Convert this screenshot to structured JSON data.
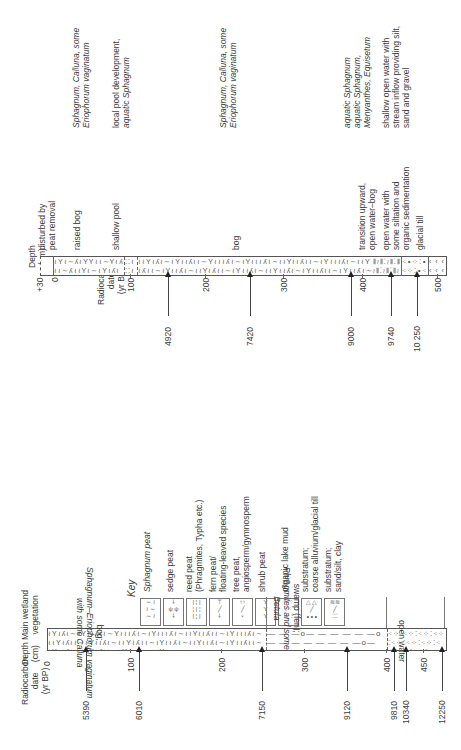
{
  "headers": {
    "radiocarbon": [
      "Radiocarbon",
      "date",
      "(yr BP)"
    ],
    "depth": [
      "Depth",
      "(cm)"
    ],
    "wetland": [
      "Main wetland",
      "vegetation"
    ]
  },
  "key": {
    "title": "Key",
    "items": [
      {
        "pattern": "sphagnum-peat",
        "label": [
          "Sphagnum peat"
        ]
      },
      {
        "pattern": "sedge-peat",
        "label": [
          "sedge peat"
        ]
      },
      {
        "pattern": "reed-peat",
        "label": [
          "reed peat",
          "(Phragmites, Typha etc.)"
        ]
      },
      {
        "pattern": "fern-peat",
        "label": [
          "fern peat/",
          "floating-leaved species"
        ]
      },
      {
        "pattern": "tree-peat",
        "label": [
          "tree peat,",
          "angiosperm/gymnosperm"
        ]
      },
      {
        "pattern": "shrub-peat",
        "label": [
          "shrub peat"
        ]
      },
      {
        "pattern": "organic-lake-mud",
        "label": [
          "organic lake mud"
        ]
      },
      {
        "pattern": "coarse-substratum",
        "label": [
          "substratum;",
          "coarse alluvium/glacial till"
        ]
      },
      {
        "pattern": "fine-substratum",
        "label": [
          "substratum;",
          "sand/silt, clay"
        ]
      }
    ]
  },
  "core_a": {
    "depth_ticks": [
      "0",
      "100",
      "200",
      "300",
      "400",
      "450"
    ],
    "dates": [
      "5390",
      "6010",
      "7150",
      "9120",
      "9810",
      "10340",
      "12250"
    ],
    "vegetation": [
      {
        "zone": [
          "bog;",
          "Sphagnum–Eriophorum vaginatum",
          "with some Calluna"
        ]
      },
      {
        "zone": [
          "swamp (fen);",
          "Phragmites and some",
          "Betula"
        ]
      },
      {
        "zone": [
          "open water"
        ]
      }
    ]
  },
  "core_b": {
    "depth_ticks": [
      "+30",
      "0",
      "100",
      "200",
      "300",
      "400",
      "500"
    ],
    "dates": [
      "4920",
      "7420",
      "9000",
      "9740",
      "10 250"
    ],
    "environments": [
      [
        "disturbed by",
        "peat removal"
      ],
      [
        "raised bog"
      ],
      [
        "shallow pool"
      ],
      [
        "bog"
      ],
      [
        "transition upward,",
        "open water–bog"
      ],
      [
        "open water with",
        "some siltation and",
        "organic sedimentation"
      ],
      [
        "glacial till"
      ]
    ],
    "vegetation": [
      [
        "Sphagnum, Calluna, some",
        "Eriophorum vaginatum"
      ],
      [
        "local pool development,",
        "aquatic Sphagnum"
      ],
      [
        "Sphagnum, Calluna, some",
        "Eriophorum vaginatum"
      ],
      [
        "aquatic Sphagnum"
      ],
      [
        "aquatic Sphagnum,",
        "Menyanthes, Equisetum"
      ],
      [
        "shallow open water with",
        "stream inflow providing silt,",
        "sand and gravel"
      ]
    ]
  }
}
